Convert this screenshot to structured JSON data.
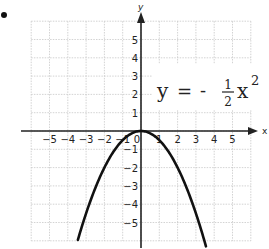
{
  "chart_data": {
    "type": "line",
    "title": "",
    "equation": {
      "lhs": "y",
      "eq": "=",
      "sign": "-",
      "numerator": "1",
      "denominator": "2",
      "var": "x",
      "exponent": "2"
    },
    "function": "y = -(1/2) x^2",
    "xlabel": "x",
    "ylabel": "y",
    "xlim": [
      -6,
      6
    ],
    "ylim": [
      -6,
      6
    ],
    "grid": true,
    "x_ticks": [
      -5,
      -4,
      -3,
      -2,
      -1,
      1,
      2,
      3,
      4,
      5
    ],
    "y_ticks": [
      5,
      4,
      3,
      2,
      1,
      -1,
      -2,
      -3,
      -4,
      -5
    ],
    "origin_label": "0",
    "series": [
      {
        "name": "y = -1/2 x^2",
        "x": [
          -3.5,
          -3,
          -2.5,
          -2,
          -1.5,
          -1,
          -0.5,
          0,
          0.5,
          1,
          1.5,
          2,
          2.5,
          3,
          3.5
        ],
        "y": [
          -6.125,
          -4.5,
          -3.125,
          -2,
          -1.125,
          -0.5,
          -0.125,
          0,
          -0.125,
          -0.5,
          -1.125,
          -2,
          -3.125,
          -4.5,
          -6.125
        ]
      }
    ],
    "colors": {
      "curve": "#111111",
      "axes": "#222222",
      "grid": "#c8c8c8",
      "text": "#222222"
    }
  }
}
